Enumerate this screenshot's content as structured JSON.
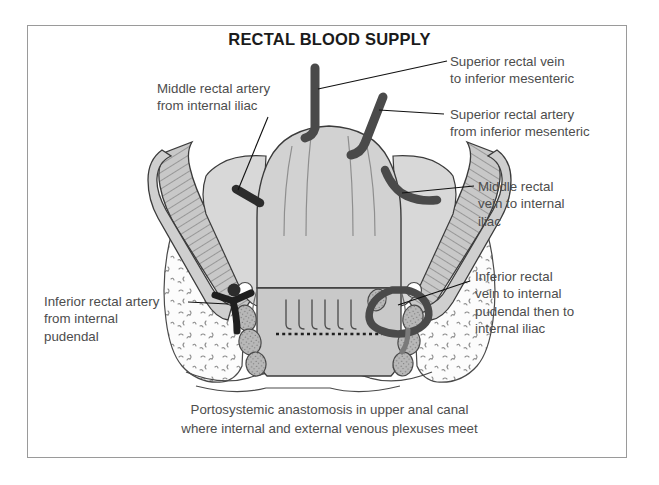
{
  "figure": {
    "title": "RECTAL BLOOD SUPPLY",
    "caption": "Portosystemic anastomosis in upper anal canal\nwhere internal and external venous plexuses meet"
  },
  "labels": {
    "superior_rectal_vein": "Superior rectal vein\nto inferior mesenteric",
    "superior_rectal_artery": "Superior rectal artery\nfrom inferior mesenteric",
    "middle_rectal_vein": "Middle rectal\nvein to internal\niliac",
    "inferior_rectal_vein": "Inferior rectal\nvein to internal\npudendal then to\ninternal iliac",
    "middle_rectal_artery": "Middle rectal artery\nfrom internal iliac",
    "inferior_rectal_artery": "Inferior rectal artery\nfrom internal\npudendal"
  },
  "colors": {
    "border": "#9a9a9a",
    "background": "#ffffff",
    "title_text": "#1b1b1b",
    "label_text": "#4d4d4d",
    "vessel_dark": "#4a4a4a",
    "outline": "#3b3b3b",
    "tissue_light": "#d2d2d2",
    "tissue_mid": "#bdbdbd",
    "muscle": "#c4c4c4",
    "fat": "#fbfbfb",
    "nodule": "#b3b3b3",
    "leader_line": "#111111"
  }
}
